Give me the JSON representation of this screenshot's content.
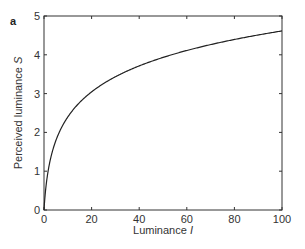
{
  "panel_label": "a",
  "chart_data": {
    "type": "line",
    "title": "",
    "xlabel": "Luminance I",
    "xlabel_main": "Luminance ",
    "xlabel_var": "I",
    "ylabel": "Perceived luminance S",
    "ylabel_main": "Perceived luminance ",
    "ylabel_var": "S",
    "xlim": [
      0,
      100
    ],
    "ylim": [
      0,
      5
    ],
    "xticks": [
      0,
      20,
      40,
      60,
      80,
      100
    ],
    "yticks": [
      0,
      1,
      2,
      3,
      4,
      5
    ],
    "grid": false,
    "legend": null,
    "series": [
      {
        "name": "S = ln(1 + I)",
        "color": "#222222",
        "x": [
          0,
          0.5,
          1,
          2,
          3,
          5,
          7,
          10,
          15,
          20,
          25,
          30,
          40,
          50,
          60,
          70,
          80,
          90,
          100
        ],
        "y": [
          0,
          0.41,
          0.69,
          1.1,
          1.39,
          1.79,
          2.08,
          2.4,
          2.77,
          3.04,
          3.26,
          3.43,
          3.71,
          3.93,
          4.11,
          4.26,
          4.39,
          4.51,
          4.62
        ]
      }
    ]
  },
  "colors": {
    "axis": "#333333",
    "line": "#222222",
    "background": "#ffffff"
  }
}
